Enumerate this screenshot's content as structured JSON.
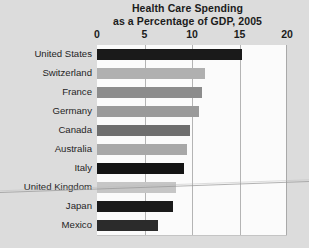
{
  "chart_data": {
    "type": "bar",
    "orientation": "horizontal",
    "title": "Health Care Spending as a Percentage of GDP, 2005",
    "title_line1": "Health Care Spending",
    "title_line2": "as a Percentage of GDP, 2005",
    "xlabel": "",
    "ylabel": "",
    "xlim": [
      0,
      20
    ],
    "xticks": [
      0,
      5,
      10,
      15,
      20
    ],
    "xtick_labels": [
      "0",
      "5",
      "10",
      "15",
      "20"
    ],
    "grid": true,
    "grid_axis": "x",
    "legend": "none",
    "categories": [
      "United States",
      "Switzerland",
      "France",
      "Germany",
      "Canada",
      "Australia",
      "Italy",
      "United Kingdom",
      "Japan",
      "Mexico"
    ],
    "values": [
      15.3,
      11.4,
      11.1,
      10.7,
      9.8,
      9.5,
      9.2,
      8.3,
      8.0,
      6.4
    ],
    "bar_colors": [
      "#1a1a1a",
      "#b0b0b0",
      "#8c8c8c",
      "#9a9a9a",
      "#6e6e6e",
      "#a8a8a8",
      "#141414",
      "#c6c6c6",
      "#1a1a1a",
      "#2b2b2b"
    ]
  },
  "style": {
    "background": "#dcdcdc",
    "plot_background": "#fbfbfb",
    "gridline_color": "#b4b4b4",
    "text_color": "#1b1b1b"
  }
}
